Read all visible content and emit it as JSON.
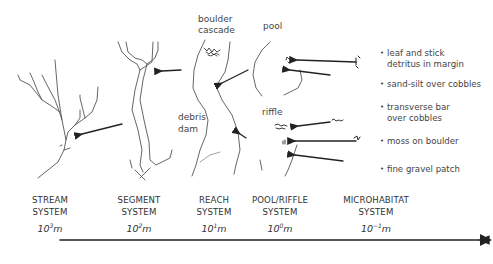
{
  "sketch_labels": {
    "boulder_cascade": "boulder\ncascade",
    "boulder": "boulder",
    "cascade": "cascade",
    "pool": "pool",
    "debris": "debris",
    "dam": "dam",
    "riffle": "riffle"
  },
  "microhabitats": [
    {
      "line1": "leaf and stick",
      "line2": "detritus in margin"
    },
    {
      "line1": "sand-silt over cobbles",
      "line2": ""
    },
    {
      "line1": "transverse bar",
      "line2": "over cobbles"
    },
    {
      "line1": "moss on boulder",
      "line2": ""
    },
    {
      "line1": "fine gravel patch",
      "line2": ""
    }
  ],
  "scales": [
    {
      "line1": "STREAM",
      "line2": "SYSTEM",
      "base": "10",
      "exp": "3",
      "unit": "m"
    },
    {
      "line1": "SEGMENT",
      "line2": "SYSTEM",
      "base": "10",
      "exp": "2",
      "unit": "m"
    },
    {
      "line1": "REACH",
      "line2": "SYSTEM",
      "base": "10",
      "exp": "1",
      "unit": "m"
    },
    {
      "line1": "POOL/RIFFLE",
      "line2": "SYSTEM",
      "base": "10",
      "exp": "0",
      "unit": "m"
    },
    {
      "line1": "MICROHABITAT",
      "line2": "SYSTEM",
      "base": "10",
      "exp": "−1",
      "unit": "m"
    }
  ],
  "colors": {
    "ink": "#333333",
    "background": "#ffffff"
  }
}
